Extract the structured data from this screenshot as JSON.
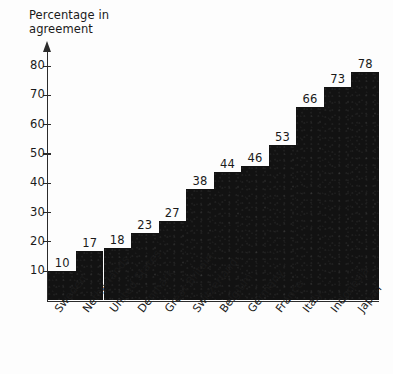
{
  "chart_data": {
    "type": "bar",
    "title": "Percentage in\nagreement",
    "xlabel": "",
    "ylabel": "Percentage in agreement",
    "ylim": [
      0,
      85
    ],
    "yticks": [
      10,
      20,
      30,
      40,
      50,
      60,
      70,
      80
    ],
    "grid": false,
    "legend": null,
    "orientation": "vertical",
    "bar_color": "#121212",
    "categories": [
      "Sweden",
      "Netherlands",
      "United States",
      "Denmark",
      "Great Britain",
      "Switzerland",
      "Belgium",
      "Germany",
      "France",
      "Italy",
      "Indonesia",
      "Japan"
    ],
    "values": [
      10,
      17,
      18,
      23,
      27,
      38,
      44,
      46,
      53,
      66,
      73,
      78
    ],
    "value_labels": [
      "10",
      "17",
      "18",
      "23",
      "27",
      "38",
      "44",
      "46",
      "53",
      "66",
      "73",
      "78"
    ]
  },
  "colors": {
    "background": "#fdfdfd",
    "axis": "#2b2b2b",
    "text": "#1a1a1a",
    "bar": "#121212"
  }
}
